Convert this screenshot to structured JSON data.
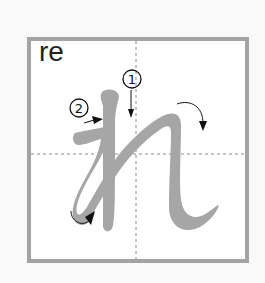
{
  "card": {
    "romaji": "re",
    "kana": "れ",
    "stroke_numbers": [
      "1",
      "2"
    ]
  },
  "colors": {
    "border": "#a3a3a3",
    "stroke": "#a6a6a6",
    "guide": "#8a8a8a",
    "arrow": "#111111"
  }
}
